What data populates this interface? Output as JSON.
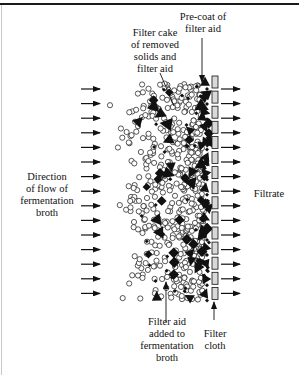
{
  "figure": {
    "labels": {
      "precoat": "Pre-coat of\nfilter aid",
      "filter_cake": "Filter cake\nof removed\nsolids and\nfilter aid",
      "direction": "Direction\nof flow of\nfermentation\nbroth",
      "filtrate": "Filtrate",
      "filter_aid_added": "Filter aid\nadded to\nfermentation\nbroth",
      "filter_cloth": "Filter\ncloth"
    },
    "colors": {
      "ink": "#111111",
      "cloth_fill": "#d9d9d9",
      "rule": "#1a1a1a",
      "background": "#ffffff"
    },
    "flow_arrows": {
      "count": 15,
      "first_y": 89,
      "spacing": 14.6,
      "left_x1": 81,
      "left_x2": 100,
      "right_x1": 221,
      "right_x2": 240
    },
    "filter_cloth": {
      "x": 212,
      "width": 6,
      "segment_height": 12,
      "count": 15,
      "first_y": 76,
      "spacing": 15.1
    },
    "particles": {
      "region_x_min": 105,
      "region_x_max": 210,
      "region_y_min": 83,
      "region_y_max": 300,
      "legend": {
        "open_circle": "solid (cells/debris)",
        "diamond": "filter aid",
        "triangle": "filter aid",
        "small_diamond": "filter aid"
      }
    },
    "leaders": {
      "precoat": {
        "x1": 202,
        "y1": 38,
        "x2": 202,
        "y2": 82
      },
      "filter_cake": {
        "x1": 160,
        "y1": 73,
        "x2": 174,
        "y2": 106
      },
      "filter_aid_added": {
        "x1": 166,
        "y1": 322,
        "x2": 166,
        "y2": 282
      },
      "filter_cloth": {
        "x1": 214,
        "y1": 320,
        "x2": 214,
        "y2": 302
      }
    }
  }
}
